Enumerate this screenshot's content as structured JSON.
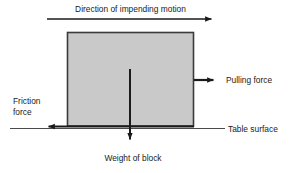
{
  "diagram": {
    "title": "Direction of impending motion",
    "labels": {
      "pulling_force": "Pulling force",
      "friction_force": "Friction\nforce",
      "table_surface": "Table surface",
      "weight_of_block": "Weight of block"
    },
    "colors": {
      "background": "#ffffff",
      "block_fill": "#c9c9c9",
      "block_stroke": "#3b3b3b",
      "arrow": "#1a1a1a",
      "thin_line": "#4a4a4a",
      "text": "#1a1a1a"
    },
    "geometry": {
      "block": {
        "x": 67,
        "y": 32,
        "width": 127,
        "height": 94
      },
      "motion_arrow": {
        "x1": 47,
        "y1": 19,
        "x2": 218,
        "y2": 19
      },
      "pulling_arrow": {
        "x1": 194,
        "y1": 80,
        "x2": 220,
        "y2": 80
      },
      "friction_arrow": {
        "x1": 194,
        "y1": 127,
        "x2": 42,
        "y2": 127
      },
      "weight_arrow": {
        "x1": 130,
        "y1": 69,
        "x2": 130,
        "y2": 146
      },
      "table_line": {
        "x1": 10,
        "y1": 128,
        "x2": 225,
        "y2": 128
      }
    }
  }
}
